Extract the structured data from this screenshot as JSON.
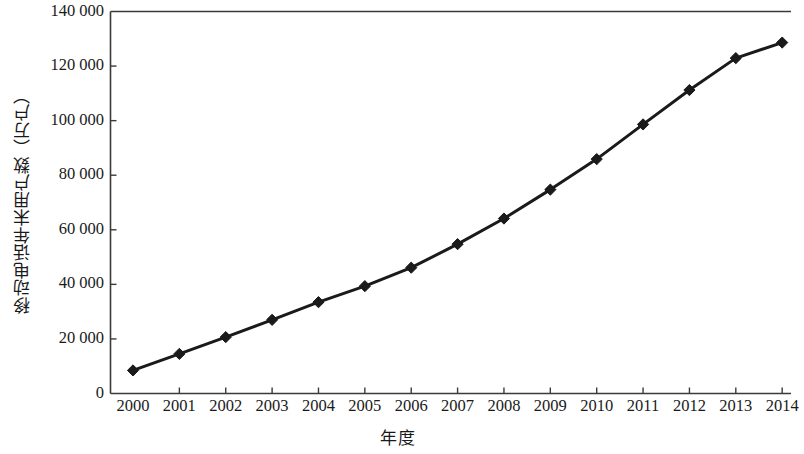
{
  "chart_data": {
    "type": "line",
    "title": "",
    "xlabel": "年度",
    "ylabel": "移动电话年末用户数（万户）",
    "categories": [
      "2000",
      "2001",
      "2002",
      "2003",
      "2004",
      "2005",
      "2006",
      "2007",
      "2008",
      "2009",
      "2010",
      "2011",
      "2012",
      "2013",
      "2014"
    ],
    "values": [
      8453,
      14522,
      20662,
      26995,
      33482,
      39341,
      46106,
      54741,
      64125,
      74721,
      85900,
      98625,
      111216,
      122911,
      128609
    ],
    "ylim": [
      0,
      140000
    ],
    "yticks": [
      0,
      20000,
      40000,
      60000,
      80000,
      100000,
      120000,
      140000
    ],
    "ytick_labels": [
      "0",
      "20 000",
      "40 000",
      "60 000",
      "80 000",
      "100 000",
      "120 000",
      "140 000"
    ],
    "xtick_labels": [
      "2000",
      "2001",
      "2002",
      "2003",
      "2004",
      "2005",
      "2006",
      "2007",
      "2008",
      "2009",
      "2010",
      "2011",
      "2012",
      "2013",
      "2014"
    ],
    "grid": false,
    "legend": null,
    "series_color": "#1a1a1a",
    "marker": "diamond",
    "line_width": 3
  },
  "axes": {
    "y_axis_name": "y-axis",
    "x_axis_name": "x-axis"
  }
}
